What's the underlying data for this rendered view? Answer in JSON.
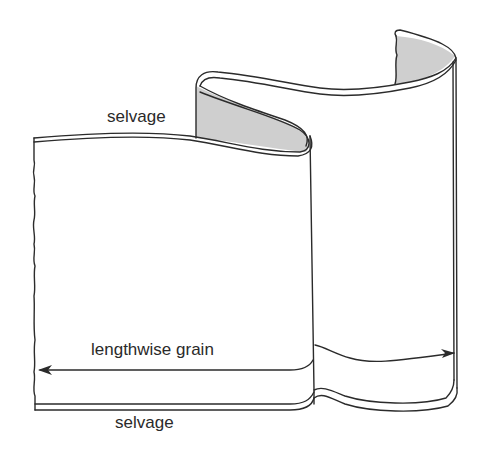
{
  "diagram": {
    "labels": {
      "selvage_top": "selvage",
      "lengthwise_grain": "lengthwise grain",
      "selvage_bottom": "selvage"
    },
    "colors": {
      "stroke": "#2b2b2b",
      "fabric": "#ffffff",
      "inside_shading": "#cfcfcf",
      "text": "#2a2a2a"
    }
  }
}
